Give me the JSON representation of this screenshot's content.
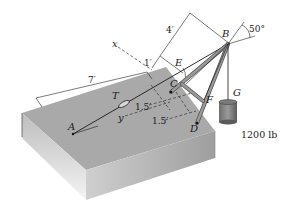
{
  "diagram": {
    "points": {
      "A": "A",
      "B": "B",
      "C": "C",
      "D": "D",
      "E": "E",
      "F": "F",
      "G": "G",
      "T": "T"
    },
    "axes": {
      "x": "x",
      "y": "y"
    },
    "dimensions": {
      "length_7ft": "7′",
      "length_4ft": "4′",
      "length_1ft": "1′",
      "length_1_5ft_a": "1.5′",
      "length_1_5ft_b": "1.5′"
    },
    "angle": "50°",
    "load": "1200 lb",
    "colors": {
      "platform_top": "#a8a8a8",
      "platform_side": "#c4c4c4",
      "member": "#8a8a8a",
      "line": "#1a1a1a"
    }
  }
}
